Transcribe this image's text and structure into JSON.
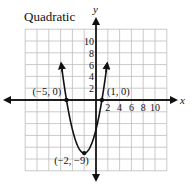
{
  "chart_data": {
    "type": "line",
    "title": "Quadratic",
    "xlabel": "x",
    "ylabel": "y",
    "xlim": [
      -12,
      12
    ],
    "ylim": [
      -12,
      12
    ],
    "grid": true,
    "grid_step": 2,
    "x_tick_labels": [
      "2",
      "4",
      "6",
      "8",
      "10"
    ],
    "y_tick_labels": [
      "2",
      "4",
      "6",
      "8",
      "10"
    ],
    "function": "y = x^2 + 4x - 5",
    "series": [
      {
        "name": "parabola",
        "x": [
          -5.9,
          -5,
          -4,
          -3,
          -2,
          -1,
          0,
          1,
          1.9
        ],
        "y": [
          10.4,
          0,
          -5,
          -8,
          -9,
          -8,
          -5,
          0,
          10.2
        ]
      }
    ],
    "annotations": [
      {
        "label": "(−5, 0)",
        "x": -5,
        "y": 0
      },
      {
        "label": "(1, 0)",
        "x": 1,
        "y": 0
      },
      {
        "label": "(−2, −9)",
        "x": -2,
        "y": -9
      }
    ]
  }
}
